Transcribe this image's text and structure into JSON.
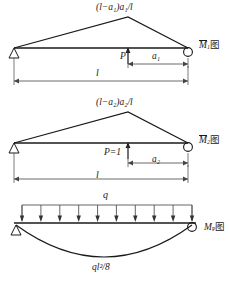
{
  "figure": {
    "type": "structural-bending-moment-diagrams",
    "panels": [
      {
        "id": "m1",
        "name": "unit-load-moment-diagram-1",
        "peak_label": "(l−a₁)a₁/l",
        "load_label": "P",
        "dim_short_label": "a₁",
        "dim_span_label": "l",
        "diagram_label_base": "M",
        "diagram_label_sub": "1",
        "diagram_label_suffix": "图",
        "supports": {
          "left": "pin",
          "right": "roller"
        },
        "load_position_fraction": 0.7,
        "shape": "triangular"
      },
      {
        "id": "m2",
        "name": "unit-load-moment-diagram-2",
        "peak_label": "(l−a₂)a₂/l",
        "load_label": "P=1",
        "dim_short_label": "a₂",
        "dim_span_label": "l",
        "diagram_label_base": "M",
        "diagram_label_sub": "2",
        "diagram_label_suffix": "图",
        "supports": {
          "left": "pin",
          "right": "roller"
        },
        "load_position_fraction": 0.7,
        "shape": "triangular"
      },
      {
        "id": "mp",
        "name": "distributed-load-moment-diagram",
        "load_label": "q",
        "peak_label": "ql²/8",
        "diagram_label_base": "M",
        "diagram_label_sub": "P",
        "diagram_label_suffix": "图",
        "supports": {
          "left": "pin",
          "right": "roller"
        },
        "arrow_count": 10,
        "shape": "parabolic"
      }
    ],
    "colors": {
      "line": "#1a1a1a",
      "thin_line": "#555555",
      "background": "#ffffff"
    }
  }
}
